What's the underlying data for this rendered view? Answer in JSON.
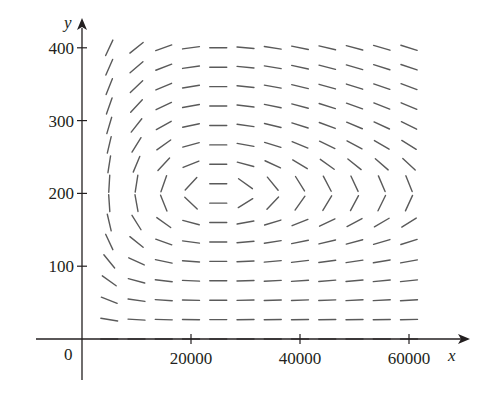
{
  "chart_data": {
    "type": "direction_field",
    "title": "",
    "xlabel": "x",
    "ylabel": "y",
    "origin_label": "0",
    "x_ticks": [
      {
        "value": 20000,
        "label": "20000"
      },
      {
        "value": 40000,
        "label": "40000"
      },
      {
        "value": 60000,
        "label": "60000"
      }
    ],
    "y_ticks": [
      {
        "value": 100,
        "label": "100"
      },
      {
        "value": 200,
        "label": "200"
      },
      {
        "value": 300,
        "label": "300"
      },
      {
        "value": 400,
        "label": "400"
      }
    ],
    "xlim": [
      0,
      65000
    ],
    "ylim": [
      0,
      420
    ],
    "grid": false,
    "equilibrium": {
      "x": 25000,
      "y": 200
    },
    "field": {
      "description": "Predator-prey style slope field dy/dx = y(-a + b x) / (x(c - d y)); horizontal segments along x=25000 and along y=0, near-vertical segments near y=200 and small x; closed orbits circle the equilibrium (25000, 200).",
      "a": 0.02,
      "b": 8e-07,
      "c": 0.08,
      "d": 0.0004,
      "x_samples": [
        5000,
        10000,
        15000,
        20000,
        25000,
        30000,
        35000,
        40000,
        45000,
        50000,
        55000,
        60000
      ],
      "row_count": 16,
      "y_top": 400,
      "y_step": 26.67
    },
    "colors": {
      "axis": "#231f20",
      "segment": "#5a5a5a",
      "text": "#231f20"
    }
  }
}
